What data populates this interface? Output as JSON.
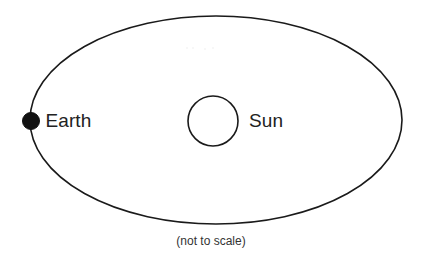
{
  "diagram": {
    "caption": "(not to scale)",
    "colors": {
      "background": "#ffffff",
      "stroke": "#1a1a1a",
      "earth_fill": "#111111",
      "sun_fill": "#ffffff",
      "label_text": "#222222",
      "caption_text": "#333333"
    },
    "orbit": {
      "shape": "ellipse",
      "center_x": 216,
      "center_y": 120,
      "radius_x": 186,
      "radius_y": 104,
      "stroke_width": 1.6,
      "fill": "none"
    },
    "bodies": [
      {
        "name": "Earth",
        "label": "Earth",
        "shape": "filled-circle",
        "center_x": 31,
        "center_y": 121,
        "radius": 8.5,
        "position_on_orbit": "left vertex of ellipse"
      },
      {
        "name": "Sun",
        "label": "Sun",
        "shape": "open-circle",
        "center_x": 213,
        "center_y": 121,
        "radius": 25,
        "stroke_width": 1.6,
        "position_on_orbit": "center of ellipse"
      }
    ]
  }
}
